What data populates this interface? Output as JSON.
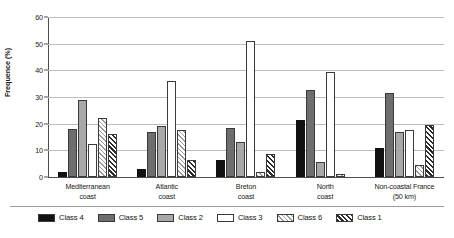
{
  "chart_data": {
    "type": "bar",
    "title": "",
    "subtitle": "",
    "xlabel": "",
    "ylabel": "Frequence (%)",
    "ylim": [
      0,
      60
    ],
    "ytick_step": 10,
    "yticks": [
      "60",
      "50",
      "40",
      "30",
      "20",
      "10",
      "0"
    ],
    "grid": true,
    "legend_position": "bottom",
    "categories": [
      "Mediterranean coast",
      "Atlantic coast",
      "Breton coast",
      "North coast",
      "Non-coastal France (50 km)"
    ],
    "category_lines": [
      [
        "Mediterranean",
        "coast"
      ],
      [
        "Atlantic",
        "coast"
      ],
      [
        "Breton",
        "coast"
      ],
      [
        "North",
        "coast"
      ],
      [
        "Non-coastal France",
        "(50 km)"
      ]
    ],
    "series": [
      {
        "name": "Class 4",
        "swatch": "class4",
        "values": [
          2,
          3,
          6.5,
          21.5,
          11
        ]
      },
      {
        "name": "Class 5",
        "swatch": "class5",
        "values": [
          18,
          17,
          18.5,
          32.5,
          31.5
        ]
      },
      {
        "name": "Class 2",
        "swatch": "class2",
        "values": [
          29,
          19,
          13,
          5.5,
          17
        ]
      },
      {
        "name": "Class 3",
        "swatch": "class3",
        "values": [
          12.5,
          36,
          51,
          39.5,
          17.5
        ]
      },
      {
        "name": "Class 6",
        "swatch": "class6",
        "values": [
          22,
          17.5,
          2,
          1,
          4.5
        ]
      },
      {
        "name": "Class 1",
        "swatch": "class1",
        "values": [
          16,
          6.5,
          8.5,
          0,
          19.5
        ]
      }
    ]
  },
  "colors": {
    "class4": "#111111",
    "class5": "#6e6e6e",
    "class2": "#a8a8a8",
    "class3": "#ffffff",
    "class6": "#9b9b9b",
    "class1": "#2b2b2b",
    "gridline": "#bdbdbd",
    "axis": "#4d4d4d",
    "background": "#ffffff"
  }
}
